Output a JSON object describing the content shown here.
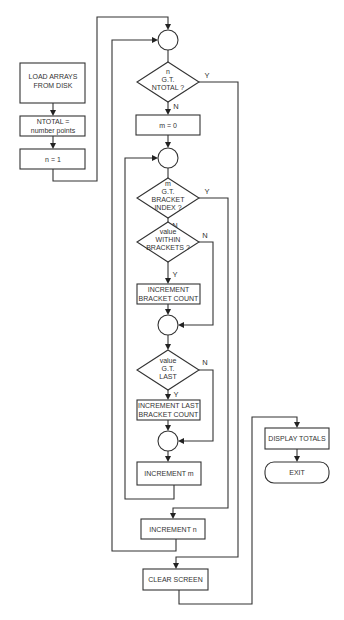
{
  "diagram": {
    "type": "flowchart",
    "nodes": {
      "load": {
        "lines": [
          "LOAD ARRAYS",
          "FROM DISK"
        ]
      },
      "ntotal": {
        "lines": [
          "NTOTAL =",
          "number points"
        ]
      },
      "n_init": {
        "label": "n = 1"
      },
      "dec_n": {
        "lines": [
          "n",
          "G.T.",
          "NTOTAL ?"
        ]
      },
      "m_init": {
        "label": "m = 0"
      },
      "dec_m": {
        "lines": [
          "m",
          "G.T.",
          "BRACKET",
          "INDEX ?"
        ]
      },
      "dec_within": {
        "lines": [
          "value",
          "WITHIN",
          "BRACKETS ?"
        ]
      },
      "inc_bracket": {
        "lines": [
          "INCREMENT",
          "BRACKET COUNT"
        ]
      },
      "dec_last": {
        "lines": [
          "value",
          "G.T.",
          "LAST"
        ]
      },
      "inc_last": {
        "lines": [
          "INCREMENT LAST",
          "BRACKET COUNT"
        ]
      },
      "inc_m": {
        "label": "INCREMENT m"
      },
      "inc_n": {
        "label": "INCREMENT n"
      },
      "clear": {
        "label": "CLEAR SCREEN"
      },
      "display": {
        "label": "DISPLAY TOTALS"
      },
      "exit": {
        "label": "EXIT"
      }
    },
    "branch_labels": {
      "dec_n_yes": "Y",
      "dec_n_no": "N",
      "dec_m_yes": "Y",
      "dec_m_no": "N",
      "dec_within_no": "N",
      "dec_within_yes": "Y",
      "dec_last_no": "N",
      "dec_last_yes": "Y"
    }
  }
}
